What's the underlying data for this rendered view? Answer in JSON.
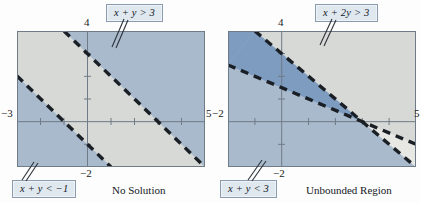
{
  "figure": {
    "panels": [
      {
        "id": "left",
        "caption": "No Solution",
        "axis": {
          "x_left_label": "−3",
          "x_right_label": "5",
          "y_top_label": "4",
          "y_bottom_label": "−2",
          "xlim": [
            -3,
            5
          ],
          "ylim": [
            -2,
            4
          ],
          "x_ticks": [
            -3,
            -2,
            -1,
            0,
            1,
            2,
            3,
            4,
            5
          ],
          "y_ticks": [
            -2,
            -1,
            0,
            1,
            2,
            3,
            4
          ]
        },
        "labels": [
          {
            "name": "upper",
            "text": "x + y > 3",
            "lhs": "x + y",
            "op": ">",
            "rhs": "3"
          },
          {
            "name": "lower",
            "text": "x + y < −1",
            "lhs": "x + y",
            "op": "<",
            "rhs": "−1"
          }
        ],
        "lines": [
          {
            "equation": "x + y = 3",
            "slope": -1,
            "intercept": 3,
            "style": "dashed"
          },
          {
            "equation": "x + y = -1",
            "slope": -1,
            "intercept": -1,
            "style": "dashed"
          }
        ],
        "regions": [
          {
            "name": "upper-half-plane",
            "inequality": "x + y > 3",
            "shade": "medium"
          },
          {
            "name": "lower-half-plane",
            "inequality": "x + y < -1",
            "shade": "medium"
          },
          {
            "name": "between-band",
            "inequality": "-1 < x + y < 3",
            "shade": "none"
          }
        ]
      },
      {
        "id": "right",
        "caption": "Unbounded Region",
        "axis": {
          "x_left_label": "−2",
          "x_right_label": "5",
          "y_top_label": "4",
          "y_bottom_label": "−2",
          "xlim": [
            -2,
            5
          ],
          "ylim": [
            -2,
            4
          ],
          "x_ticks": [
            -2,
            -1,
            0,
            1,
            2,
            3,
            4,
            5
          ],
          "y_ticks": [
            -2,
            -1,
            0,
            1,
            2,
            3,
            4
          ]
        },
        "labels": [
          {
            "name": "upper",
            "text": "x + 2y > 3",
            "lhs": "x + 2y",
            "op": ">",
            "rhs": "3"
          },
          {
            "name": "lower",
            "text": "x + y < 3",
            "lhs": "x + y",
            "op": "<",
            "rhs": "3"
          }
        ],
        "lines": [
          {
            "equation": "x + 2y = 3",
            "slope": -0.5,
            "intercept": 1.5,
            "style": "dashed"
          },
          {
            "equation": "x + y = 3",
            "slope": -1,
            "intercept": 3,
            "style": "dashed"
          }
        ],
        "regions": [
          {
            "name": "overlap",
            "inequality": "x + 2y > 3 and x + y < 3",
            "shade": "dark"
          },
          {
            "name": "single-shade",
            "inequality": "x + y < 3 only",
            "shade": "medium"
          },
          {
            "name": "wedge",
            "inequality": "neither",
            "shade": "none"
          }
        ]
      }
    ],
    "colors": {
      "shade_light": "#d5d7d4",
      "shade_medium": "#a9bacd",
      "shade_dark": "#7d9cc0",
      "line": "#1a1f25",
      "axis": "#6f7b87",
      "frame": "#6f7b87",
      "chip_fill": "#dfe7ef",
      "chip_border": "#8a9bad",
      "text": "#14181d"
    }
  }
}
